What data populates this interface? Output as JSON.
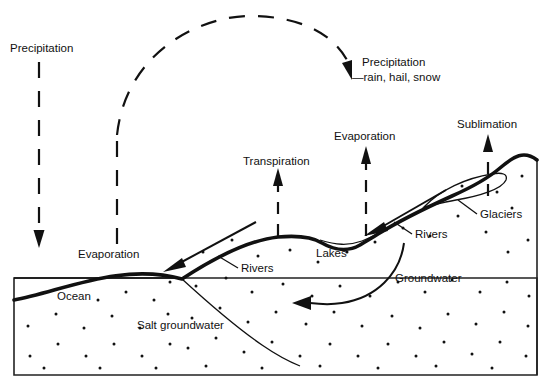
{
  "diagram": {
    "labels": {
      "precipitation_left": "Precipitation",
      "precipitation_right": "Precipitation",
      "precipitation_right_sub": "—rain, hail, snow",
      "evaporation_ocean": "Evaporation",
      "transpiration": "Transpiration",
      "evaporation_land": "Evaporation",
      "sublimation": "Sublimation",
      "glaciers": "Glaciers",
      "rivers_upper": "Rivers",
      "rivers_lower": "Rivers",
      "lakes": "Lakes",
      "groundwater": "Groundwater",
      "ocean": "Ocean",
      "salt_groundwater": "Salt groundwater"
    },
    "colors": {
      "ink": "#111111",
      "background": "#ffffff",
      "frame": "#222222"
    },
    "flows": [
      {
        "name": "precipitation-down-arrow",
        "direction": "down",
        "style": "dashed"
      },
      {
        "name": "evaporation-up-dashed",
        "direction": "up",
        "style": "dashed"
      },
      {
        "name": "atmospheric-transport-arc",
        "direction": "left-to-right",
        "style": "dashed"
      },
      {
        "name": "precipitation-arrival-arrow",
        "direction": "down-right",
        "style": "dashed"
      },
      {
        "name": "transpiration-up-arrow",
        "direction": "up",
        "style": "dashed"
      },
      {
        "name": "evaporation-land-up-arrow",
        "direction": "up",
        "style": "dashed"
      },
      {
        "name": "sublimation-up-arrow",
        "direction": "up",
        "style": "dashed"
      },
      {
        "name": "river-flow-upper-arrow",
        "direction": "down-left",
        "style": "solid"
      },
      {
        "name": "river-flow-lower-arrow",
        "direction": "down-left",
        "style": "solid"
      },
      {
        "name": "groundwater-flow-arrow",
        "direction": "curved-left",
        "style": "solid"
      }
    ]
  }
}
